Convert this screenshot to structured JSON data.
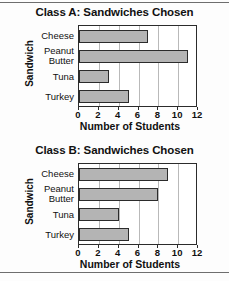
{
  "page": {
    "background_color": "#fdfdfd",
    "rule_color": "#6e6e6e"
  },
  "charts": [
    {
      "title": "Class A: Sandwiches Chosen",
      "ylabel": "Sandwich",
      "xlabel": "Number of Students",
      "categories": [
        "Cheese",
        "Peanut Butter",
        "Tuna",
        "Turkey"
      ],
      "values": [
        7,
        11,
        3,
        5
      ],
      "ticks": [
        "0",
        "2",
        "4",
        "6",
        "8",
        "10",
        "12"
      ]
    },
    {
      "title": "Class B: Sandwiches Chosen",
      "ylabel": "Sandwich",
      "xlabel": "Number of Students",
      "categories": [
        "Cheese",
        "Peanut Butter",
        "Tuna",
        "Turkey"
      ],
      "values": [
        9,
        8,
        4,
        5
      ],
      "ticks": [
        "0",
        "2",
        "4",
        "6",
        "8",
        "10",
        "12"
      ]
    }
  ],
  "chart_data": [
    {
      "type": "bar",
      "orientation": "horizontal",
      "title": "Class A: Sandwiches Chosen",
      "categories": [
        "Cheese",
        "Peanut Butter",
        "Tuna",
        "Turkey"
      ],
      "values": [
        7,
        11,
        3,
        5
      ],
      "xlabel": "Number of Students",
      "ylabel": "Sandwich",
      "xlim": [
        0,
        12
      ],
      "xticks": [
        0,
        2,
        4,
        6,
        8,
        10,
        12
      ],
      "grid": true,
      "legend": false,
      "bar_color": "#b4b4b4",
      "bar_edge_color": "#2b2b2b"
    },
    {
      "type": "bar",
      "orientation": "horizontal",
      "title": "Class B: Sandwiches Chosen",
      "categories": [
        "Cheese",
        "Peanut Butter",
        "Tuna",
        "Turkey"
      ],
      "values": [
        9,
        8,
        4,
        5
      ],
      "xlabel": "Number of Students",
      "ylabel": "Sandwich",
      "xlim": [
        0,
        12
      ],
      "xticks": [
        0,
        2,
        4,
        6,
        8,
        10,
        12
      ],
      "grid": true,
      "legend": false,
      "bar_color": "#b4b4b4",
      "bar_edge_color": "#2b2b2b"
    }
  ]
}
